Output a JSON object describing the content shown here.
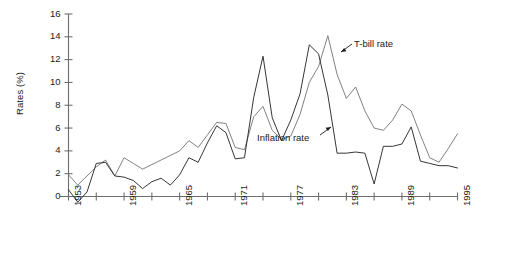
{
  "chart_data": {
    "type": "line",
    "title": "",
    "subtitle": "",
    "xlabel": "",
    "ylabel": "Rates (%)",
    "xlim": [
      1953,
      1995
    ],
    "ylim": [
      0,
      16
    ],
    "y_ticks": [
      0,
      2,
      4,
      6,
      8,
      10,
      12,
      14,
      16
    ],
    "x_ticks": [
      1953,
      1956,
      1959,
      1962,
      1965,
      1968,
      1971,
      1974,
      1977,
      1980,
      1983,
      1986,
      1989,
      1992,
      1995
    ],
    "x_tick_labels": [
      "1953",
      "",
      "1959",
      "",
      "1965",
      "",
      "1971",
      "",
      "1977",
      "",
      "1983",
      "",
      "1989",
      "",
      "1995"
    ],
    "x_tick_labels_shown": [
      "1953",
      "1959",
      "1965",
      "1971",
      "1977",
      "1983",
      "1989",
      "1995"
    ],
    "grid": false,
    "legend_position": "inline-annotations",
    "x": [
      1953,
      1954,
      1955,
      1956,
      1957,
      1958,
      1959,
      1960,
      1961,
      1962,
      1963,
      1964,
      1965,
      1966,
      1967,
      1968,
      1969,
      1970,
      1971,
      1972,
      1973,
      1974,
      1975,
      1976,
      1977,
      1978,
      1979,
      1980,
      1981,
      1982,
      1983,
      1984,
      1985,
      1986,
      1987,
      1988,
      1989,
      1990,
      1991,
      1992,
      1993,
      1994,
      1995
    ],
    "series": [
      {
        "name": "T-bill rate",
        "color": "#7a7a7a",
        "values": [
          1.9,
          1.0,
          1.8,
          2.6,
          3.2,
          1.8,
          3.4,
          2.9,
          2.4,
          2.8,
          3.2,
          3.6,
          4.0,
          4.9,
          4.3,
          5.4,
          6.5,
          6.4,
          4.3,
          4.1,
          7.0,
          7.9,
          5.8,
          5.0,
          5.3,
          7.2,
          10.0,
          11.4,
          14.1,
          10.7,
          8.6,
          9.6,
          7.5,
          6.0,
          5.8,
          6.7,
          8.1,
          7.5,
          5.4,
          3.4,
          3.0,
          4.2,
          5.5
        ]
      },
      {
        "name": "Inflation rate",
        "color": "#2b2b2b",
        "values": [
          0.6,
          -0.5,
          0.4,
          2.9,
          3.0,
          1.8,
          1.7,
          1.4,
          0.7,
          1.3,
          1.6,
          1.0,
          1.9,
          3.4,
          3.0,
          4.7,
          6.2,
          5.6,
          3.3,
          3.4,
          8.7,
          12.3,
          6.9,
          4.9,
          6.7,
          9.0,
          13.3,
          12.5,
          8.9,
          3.8,
          3.8,
          3.9,
          3.8,
          1.1,
          4.4,
          4.4,
          4.6,
          6.1,
          3.1,
          2.9,
          2.7,
          2.7,
          2.5
        ]
      }
    ],
    "annotations": [
      {
        "text": "T-bill rate",
        "points_to": "T-bill rate peak near 1981"
      },
      {
        "text": "Inflation rate",
        "points_to": "Inflation rate trough near 1977"
      }
    ]
  },
  "axis": {
    "y_title": "Rates (%)",
    "y_labels": [
      "16",
      "14",
      "12",
      "10",
      "8",
      "6",
      "4",
      "2",
      "0"
    ],
    "x_labels": [
      "1953",
      "1959",
      "1965",
      "1971",
      "1977",
      "1983",
      "1989",
      "1995"
    ]
  },
  "labels": {
    "tbill": "T-bill rate",
    "inflation": "Inflation rate"
  },
  "colors": {
    "tbill_line": "#7a7a7a",
    "inflation_line": "#2b2b2b",
    "axis": "#6e6e6e",
    "text": "#1a1a1a",
    "background": "#ffffff"
  }
}
